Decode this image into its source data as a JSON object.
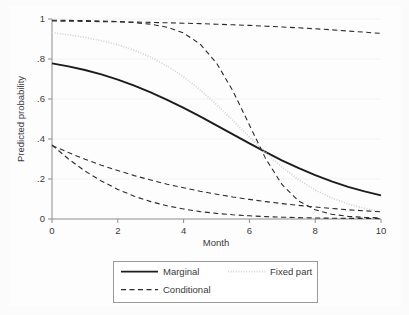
{
  "chart_data": {
    "type": "line",
    "title": "",
    "xlabel": "Month",
    "ylabel": "Predicted probability",
    "xlim": [
      0,
      10
    ],
    "ylim": [
      0,
      1
    ],
    "grid": true,
    "grid_axis": "y",
    "legend_position": "bottom",
    "xticks": [
      0,
      2,
      4,
      6,
      8,
      10
    ],
    "xtick_labels": [
      "0",
      "2",
      "4",
      "6",
      "8",
      "10"
    ],
    "yticks": [
      0,
      0.2,
      0.4,
      0.6,
      0.8,
      1
    ],
    "ytick_labels": [
      "0",
      ".2",
      ".4",
      ".6",
      ".8",
      "1"
    ],
    "x": [
      0,
      0.5,
      1,
      1.5,
      2,
      2.5,
      3,
      3.5,
      4,
      4.5,
      5,
      5.5,
      6,
      6.5,
      7,
      7.5,
      8,
      8.5,
      9,
      9.5,
      10
    ],
    "series": [
      {
        "name": "Marginal",
        "style": "solid",
        "color": "#1c1c1c",
        "values": [
          0.778,
          0.763,
          0.745,
          0.723,
          0.697,
          0.667,
          0.633,
          0.596,
          0.556,
          0.513,
          0.468,
          0.423,
          0.378,
          0.334,
          0.292,
          0.254,
          0.219,
          0.188,
          0.161,
          0.138,
          0.118
        ]
      },
      {
        "name": "Fixed part",
        "style": "dotted",
        "color": "#d2d2d2",
        "values": [
          0.931,
          0.921,
          0.908,
          0.892,
          0.871,
          0.844,
          0.809,
          0.765,
          0.711,
          0.646,
          0.572,
          0.492,
          0.41,
          0.33,
          0.258,
          0.196,
          0.145,
          0.105,
          0.075,
          0.053,
          0.037
        ]
      },
      {
        "name": "Conditional",
        "style": "dashed",
        "color": "#2b2b2b",
        "sublines": [
          {
            "id": "conditional-upper",
            "values": [
              0.99,
              0.989,
              0.988,
              0.987,
              0.986,
              0.985,
              0.983,
              0.981,
              0.979,
              0.977,
              0.974,
              0.971,
              0.968,
              0.964,
              0.96,
              0.956,
              0.951,
              0.946,
              0.94,
              0.934,
              0.928
            ]
          },
          {
            "id": "conditional-steep",
            "values": [
              0.994,
              0.993,
              0.992,
              0.99,
              0.987,
              0.982,
              0.974,
              0.959,
              0.93,
              0.875,
              0.78,
              0.64,
              0.47,
              0.3,
              0.17,
              0.09,
              0.046,
              0.024,
              0.013,
              0.008,
              0.006
            ]
          },
          {
            "id": "conditional-mid-lower",
            "values": [
              0.368,
              0.332,
              0.299,
              0.269,
              0.242,
              0.217,
              0.195,
              0.174,
              0.156,
              0.139,
              0.124,
              0.11,
              0.098,
              0.087,
              0.077,
              0.068,
              0.06,
              0.053,
              0.046,
              0.041,
              0.036
            ]
          },
          {
            "id": "conditional-lower",
            "values": [
              0.37,
              0.3,
              0.24,
              0.19,
              0.148,
              0.114,
              0.087,
              0.066,
              0.05,
              0.037,
              0.028,
              0.021,
              0.016,
              0.012,
              0.009,
              0.007,
              0.005,
              0.004,
              0.003,
              0.003,
              0.002
            ]
          }
        ]
      }
    ],
    "legend_entries": [
      {
        "label": "Marginal",
        "style": "solid"
      },
      {
        "label": "Fixed part",
        "style": "dotted"
      },
      {
        "label": "Conditional",
        "style": "dashed"
      }
    ]
  }
}
